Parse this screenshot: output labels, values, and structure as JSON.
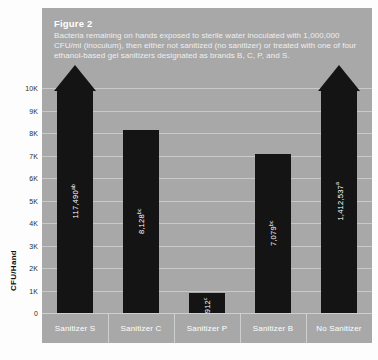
{
  "caption": {
    "title": "Figure 2",
    "body": "Bacteria remaining on hands exposed to sterile water inoculated with 1,000,000 CFU/ml (inoculum), then either not sanitized (no sanitizer) or treated with one of four ethanol-based gel sanitizers designated as brands B, C, P, and S."
  },
  "axis": {
    "y_title": "CFU/Hand",
    "y_ticks": [
      "10K",
      "9K",
      "8K",
      "7K",
      "6K",
      "5K",
      "4K",
      "3K",
      "2K",
      "1K",
      "0"
    ]
  },
  "colors": {
    "panel": "#a8a8a8",
    "bar": "#141414",
    "gridline": "#c9c9c9",
    "text_light": "#ffffff",
    "text_dark": "#2b2b2b"
  },
  "chart_data": {
    "type": "bar",
    "title": "Figure 2",
    "subtitle": "Bacteria remaining on hands exposed to sterile water inoculated with 1,000,000 CFU/ml (inoculum), then either not sanitized (no sanitizer) or treated with one of four ethanol-based gel sanitizers designated as brands B, C, P, and S.",
    "xlabel": "",
    "ylabel": "CFU/Hand",
    "ylim": [
      0,
      10000
    ],
    "ytick_values": [
      10000,
      9000,
      8000,
      7000,
      6000,
      5000,
      4000,
      3000,
      2000,
      1000,
      0
    ],
    "grid": true,
    "legend": "none",
    "categories": [
      "Sanitizer S",
      "Sanitizer C",
      "Sanitizer P",
      "Sanitizer B",
      "No Sanitizer"
    ],
    "values": [
      117490,
      8128,
      912,
      7079,
      1412537
    ],
    "bars": [
      {
        "category": "Sanitizer S",
        "value": 117490,
        "label": "117,490",
        "superscript": "ab",
        "off_scale": true,
        "drawn_height_k": 10.0
      },
      {
        "category": "Sanitizer C",
        "value": 8128,
        "label": "8,128",
        "superscript": "bc",
        "off_scale": false,
        "drawn_height_k": 8.13
      },
      {
        "category": "Sanitizer P",
        "value": 912,
        "label": "912",
        "superscript": "c",
        "off_scale": false,
        "drawn_height_k": 0.91
      },
      {
        "category": "Sanitizer B",
        "value": 7079,
        "label": "7,079",
        "superscript": "bc",
        "off_scale": false,
        "drawn_height_k": 7.08
      },
      {
        "category": "No Sanitizer",
        "value": 1412537,
        "label": "1,412,537",
        "superscript": "a",
        "off_scale": true,
        "drawn_height_k": 10.0
      }
    ]
  }
}
